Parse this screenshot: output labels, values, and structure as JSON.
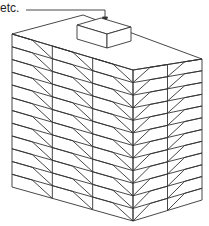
{
  "annotation": {
    "text": "etc."
  },
  "diagram": {
    "stroke_color": "#333333",
    "background": "#ffffff",
    "floors": 12
  }
}
